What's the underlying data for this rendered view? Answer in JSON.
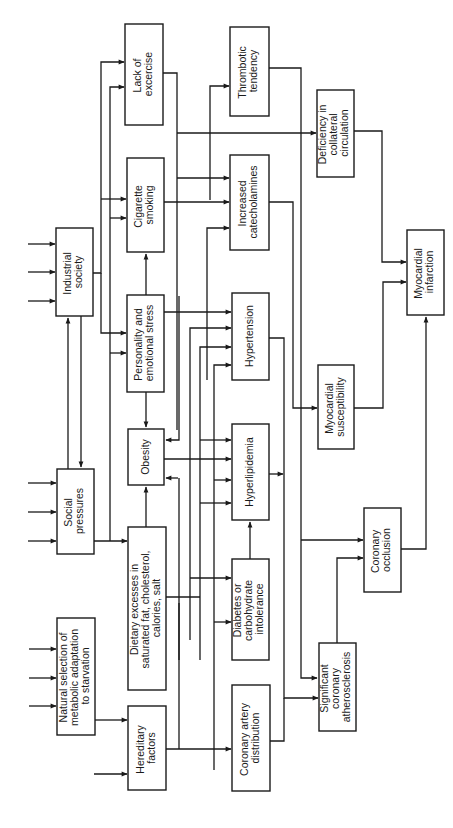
{
  "diagram": {
    "type": "flowchart",
    "orientation": "rotated-90-ccw",
    "colors": {
      "line": "#1a1a1a",
      "box_fill": "#ffffff",
      "background": "#ffffff"
    },
    "nodes": [
      {
        "id": "natural_selection",
        "lines": [
          "Natural selection of",
          "metabolic adaptation",
          "to starvation"
        ]
      },
      {
        "id": "hereditary",
        "lines": [
          "Hereditary",
          "factors"
        ]
      },
      {
        "id": "social",
        "lines": [
          "Social",
          "pressures"
        ]
      },
      {
        "id": "industrial",
        "lines": [
          "Industrial",
          "society"
        ]
      },
      {
        "id": "dietary",
        "lines": [
          "Dietary excesses in",
          "saturated fat, cholesterol,",
          "calories, salt"
        ]
      },
      {
        "id": "obesity",
        "lines": [
          "Obesity"
        ]
      },
      {
        "id": "personality",
        "lines": [
          "Personality and",
          "emotional stress"
        ]
      },
      {
        "id": "cigarette",
        "lines": [
          "Cigarette",
          "smoking"
        ]
      },
      {
        "id": "exercise",
        "lines": [
          "Lack of",
          "excercise"
        ]
      },
      {
        "id": "coronary_dist",
        "lines": [
          "Coronary artery",
          "distribution"
        ]
      },
      {
        "id": "diabetes",
        "lines": [
          "Diabetes or",
          "carbohydrate",
          "intolerance"
        ]
      },
      {
        "id": "hyperlipidemia",
        "lines": [
          "Hyperlipidemia"
        ]
      },
      {
        "id": "hypertension",
        "lines": [
          "Hypertension"
        ]
      },
      {
        "id": "catecholamines",
        "lines": [
          "Increased",
          "catecholamines"
        ]
      },
      {
        "id": "thrombotic",
        "lines": [
          "Thrombotic",
          "tendency"
        ]
      },
      {
        "id": "atherosclerosis",
        "lines": [
          "Significant",
          "coronary",
          "atherosclerosis"
        ]
      },
      {
        "id": "occlusion",
        "lines": [
          "Coronary",
          "occlusion"
        ]
      },
      {
        "id": "susceptibility",
        "lines": [
          "Myocardial",
          "susceptibility"
        ]
      },
      {
        "id": "collateral",
        "lines": [
          "Deficiency in",
          "collateral",
          "circulation"
        ]
      },
      {
        "id": "infarction",
        "lines": [
          "Myocardial",
          "infarction"
        ]
      }
    ],
    "edges": [
      [
        "natural_selection",
        "hereditary"
      ],
      [
        "industrial",
        "social"
      ],
      [
        "social",
        "industrial"
      ],
      [
        "social",
        "dietary"
      ],
      [
        "industrial",
        "personality"
      ],
      [
        "industrial",
        "cigarette"
      ],
      [
        "industrial",
        "exercise"
      ],
      [
        "dietary",
        "obesity"
      ],
      [
        "personality",
        "obesity"
      ],
      [
        "personality",
        "cigarette"
      ],
      [
        "hereditary",
        "coronary_dist"
      ],
      [
        "hereditary",
        "diabetes"
      ],
      [
        "hereditary",
        "hyperlipidemia"
      ],
      [
        "hereditary",
        "hypertension"
      ],
      [
        "dietary",
        "hyperlipidemia"
      ],
      [
        "dietary",
        "hypertension"
      ],
      [
        "dietary",
        "diabetes"
      ],
      [
        "obesity",
        "hyperlipidemia"
      ],
      [
        "obesity",
        "hypertension"
      ],
      [
        "obesity",
        "diabetes"
      ],
      [
        "personality",
        "hypertension"
      ],
      [
        "personality",
        "catecholamines"
      ],
      [
        "cigarette",
        "catecholamines"
      ],
      [
        "cigarette",
        "thrombotic"
      ],
      [
        "exercise",
        "catecholamines"
      ],
      [
        "exercise",
        "collateral"
      ],
      [
        "diabetes",
        "hyperlipidemia"
      ],
      [
        "hypertension",
        "atherosclerosis"
      ],
      [
        "hyperlipidemia",
        "atherosclerosis"
      ],
      [
        "coronary_dist",
        "atherosclerosis"
      ],
      [
        "catecholamines",
        "susceptibility"
      ],
      [
        "thrombotic",
        "occlusion"
      ],
      [
        "atherosclerosis",
        "occlusion"
      ],
      [
        "susceptibility",
        "infarction"
      ],
      [
        "collateral",
        "infarction"
      ],
      [
        "occlusion",
        "infarction"
      ]
    ]
  }
}
